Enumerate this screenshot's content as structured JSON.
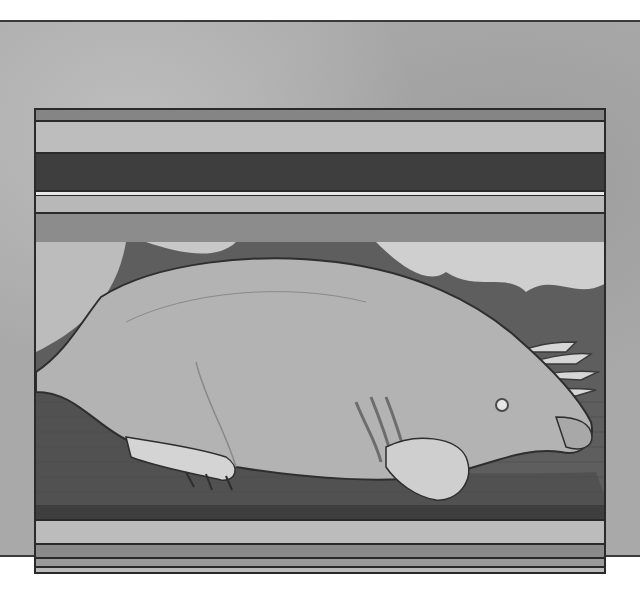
{
  "image": {
    "subject": "illustration of a mole lying on soil",
    "style": "grayscale painted illustration framed by horizontal bands",
    "colors": {
      "background": "#a9a9a9",
      "frame_border": "#2a2a2a",
      "band_dark": "#3c3c3c",
      "band_mid": "#8a8a8a",
      "band_light": "#bcbcbc",
      "mole_body": "#b4b4b4",
      "soil": "#5a5a5a"
    },
    "bands_top": [
      {
        "shade": "mid",
        "height": 12
      },
      {
        "shade": "light",
        "height": 32
      },
      {
        "shade": "dark",
        "height": 36
      },
      {
        "shade": "light",
        "height": 22
      },
      {
        "shade": "mid",
        "height": 30
      }
    ],
    "bands_bottom": [
      {
        "shade": "dark",
        "height": 16
      },
      {
        "shade": "light",
        "height": 24
      },
      {
        "shade": "mid",
        "height": 14
      },
      {
        "shade": "mid",
        "height": 9
      },
      {
        "shade": "light",
        "height": 20
      }
    ]
  }
}
